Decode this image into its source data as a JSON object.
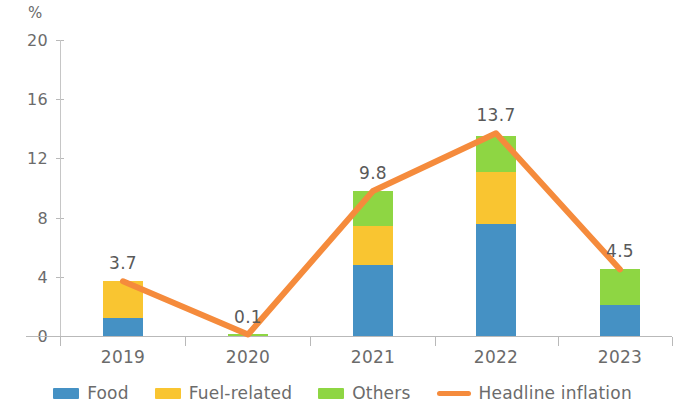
{
  "chart_data": {
    "type": "bar",
    "title": "",
    "subtitle": "",
    "xlabel": "",
    "ylabel": "%",
    "ylim": [
      0,
      20
    ],
    "yticks": [
      0,
      4,
      8,
      12,
      16,
      20
    ],
    "ytick_labels": [
      "0",
      "4",
      "8",
      "12",
      "16",
      "20"
    ],
    "grid": false,
    "legend_position": "bottom",
    "stacked": true,
    "categories": [
      "2019",
      "2020",
      "2021",
      "2022",
      "2023"
    ],
    "series": [
      {
        "name": "Food",
        "type": "bar",
        "color": "#4591c4",
        "values": [
          1.2,
          0.0,
          4.8,
          7.6,
          2.1
        ]
      },
      {
        "name": "Fuel-related",
        "type": "bar",
        "color": "#f9c531",
        "values": [
          2.5,
          0.0,
          2.6,
          3.5,
          0.0
        ]
      },
      {
        "name": "Others",
        "type": "bar",
        "color": "#8ed643",
        "values": [
          0.0,
          0.1,
          2.4,
          2.4,
          2.4
        ]
      },
      {
        "name": "Headline inflation",
        "type": "line",
        "color": "#f58b3c",
        "values": [
          3.7,
          0.1,
          9.8,
          13.7,
          4.5
        ]
      }
    ],
    "data_labels": [
      "3.7",
      "0.1",
      "9.8",
      "13.7",
      "4.5"
    ]
  },
  "legend": {
    "items": [
      {
        "label": "Food",
        "color": "#4591c4",
        "marker": "swatch"
      },
      {
        "label": "Fuel-related",
        "color": "#f9c531",
        "marker": "swatch"
      },
      {
        "label": "Others",
        "color": "#8ed643",
        "marker": "swatch"
      },
      {
        "label": "Headline inflation",
        "color": "#f58b3c",
        "marker": "line"
      }
    ]
  }
}
